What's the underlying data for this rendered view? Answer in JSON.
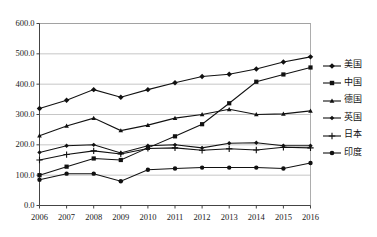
{
  "chart_data": {
    "type": "line",
    "title": "",
    "xlabel": "",
    "ylabel": "",
    "grid": true,
    "legend_position": "right",
    "ylim": [
      0,
      600
    ],
    "yticks": [
      "0.0",
      "100.0",
      "200.0",
      "300.0",
      "400.0",
      "500.0",
      "600.0"
    ],
    "ytick_values": [
      0,
      100,
      200,
      300,
      400,
      500,
      600
    ],
    "categories": [
      "2006",
      "2007",
      "2008",
      "2009",
      "2010",
      "2011",
      "2012",
      "2013",
      "2014",
      "2015",
      "2016"
    ],
    "x": [
      2006,
      2007,
      2008,
      2009,
      2010,
      2011,
      2012,
      2013,
      2014,
      2015,
      2016
    ],
    "series": [
      {
        "name": "美国",
        "marker": "diamond",
        "color": "#111111",
        "values": [
          320,
          347,
          382,
          357,
          382,
          405,
          425,
          433,
          450,
          473,
          490
        ]
      },
      {
        "name": "中国",
        "marker": "square",
        "color": "#111111",
        "values": [
          100,
          128,
          155,
          150,
          190,
          228,
          268,
          337,
          408,
          432,
          455
        ]
      },
      {
        "name": "德国",
        "marker": "triangle",
        "color": "#111111",
        "values": [
          230,
          262,
          288,
          247,
          265,
          288,
          300,
          317,
          300,
          302,
          312
        ]
      },
      {
        "name": "英国",
        "marker": "diamond-small",
        "color": "#111111",
        "values": [
          175,
          197,
          200,
          173,
          197,
          200,
          190,
          205,
          207,
          197,
          197
        ]
      },
      {
        "name": "日本",
        "marker": "plus",
        "color": "#111111",
        "values": [
          150,
          168,
          180,
          170,
          188,
          190,
          182,
          187,
          183,
          192,
          190
        ]
      },
      {
        "name": "印度",
        "marker": "circle",
        "color": "#111111",
        "values": [
          85,
          105,
          105,
          80,
          118,
          122,
          125,
          125,
          125,
          122,
          140
        ]
      }
    ]
  },
  "legend": {
    "items": [
      {
        "label": "美国"
      },
      {
        "label": "中国"
      },
      {
        "label": "德国"
      },
      {
        "label": "英国"
      },
      {
        "label": "日本"
      },
      {
        "label": "印度"
      }
    ]
  }
}
